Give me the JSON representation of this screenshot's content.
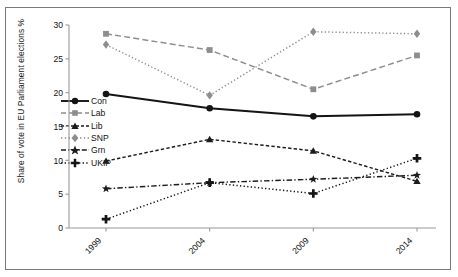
{
  "chart_data": {
    "type": "line",
    "title": "",
    "xlabel": "",
    "ylabel": "Share of vote in EU Parliament elections %",
    "categories": [
      "1999",
      "2004",
      "2009",
      "2014"
    ],
    "x": [
      1999,
      2004,
      2009,
      2014
    ],
    "ylim": [
      0,
      30
    ],
    "yticks": [
      0,
      5,
      10,
      15,
      20,
      25,
      30
    ],
    "ytick_labels": [
      "0",
      "5",
      "10",
      "15",
      "20",
      "25",
      "30"
    ],
    "grid": false,
    "legend_position": "inside-left",
    "xtick_rotation": -45,
    "series": [
      {
        "name": "Con",
        "values": [
          19.8,
          17.7,
          16.5,
          16.8
        ],
        "color": "#141414",
        "dash": "solid",
        "marker": "circle"
      },
      {
        "name": "Lab",
        "values": [
          28.7,
          26.3,
          20.5,
          25.5
        ],
        "color": "#8d8d8d",
        "dash": "dashed",
        "marker": "square"
      },
      {
        "name": "Lib",
        "values": [
          9.9,
          13.1,
          11.4,
          6.9
        ],
        "color": "#1c1c1c",
        "dash": "dash-sm",
        "marker": "triangle"
      },
      {
        "name": "SNP",
        "values": [
          27.1,
          19.6,
          29.0,
          28.7
        ],
        "color": "#8d8d8d",
        "dash": "dotted",
        "marker": "diamond"
      },
      {
        "name": "Grn",
        "values": [
          5.8,
          6.7,
          7.2,
          7.8
        ],
        "color": "#1c1c1c",
        "dash": "dashdot",
        "marker": "star"
      },
      {
        "name": "UKIP",
        "values": [
          1.3,
          6.7,
          5.1,
          10.3
        ],
        "color": "#141414",
        "dash": "dotted",
        "marker": "plus"
      }
    ]
  },
  "axis": {
    "ylabel": "Share of vote in EU Parliament elections %"
  },
  "legend": {
    "items": [
      {
        "label": "Con"
      },
      {
        "label": "Lab"
      },
      {
        "label": "Lib"
      },
      {
        "label": "SNP"
      },
      {
        "label": "Grn"
      },
      {
        "label": "UKIP"
      }
    ]
  },
  "colors": {
    "frame_border": "#7a7a7a",
    "axis": "#9a9a9a",
    "text": "#111111",
    "grey_series": "#8d8d8d",
    "dark_series": "#141414",
    "background": "#ffffff"
  }
}
